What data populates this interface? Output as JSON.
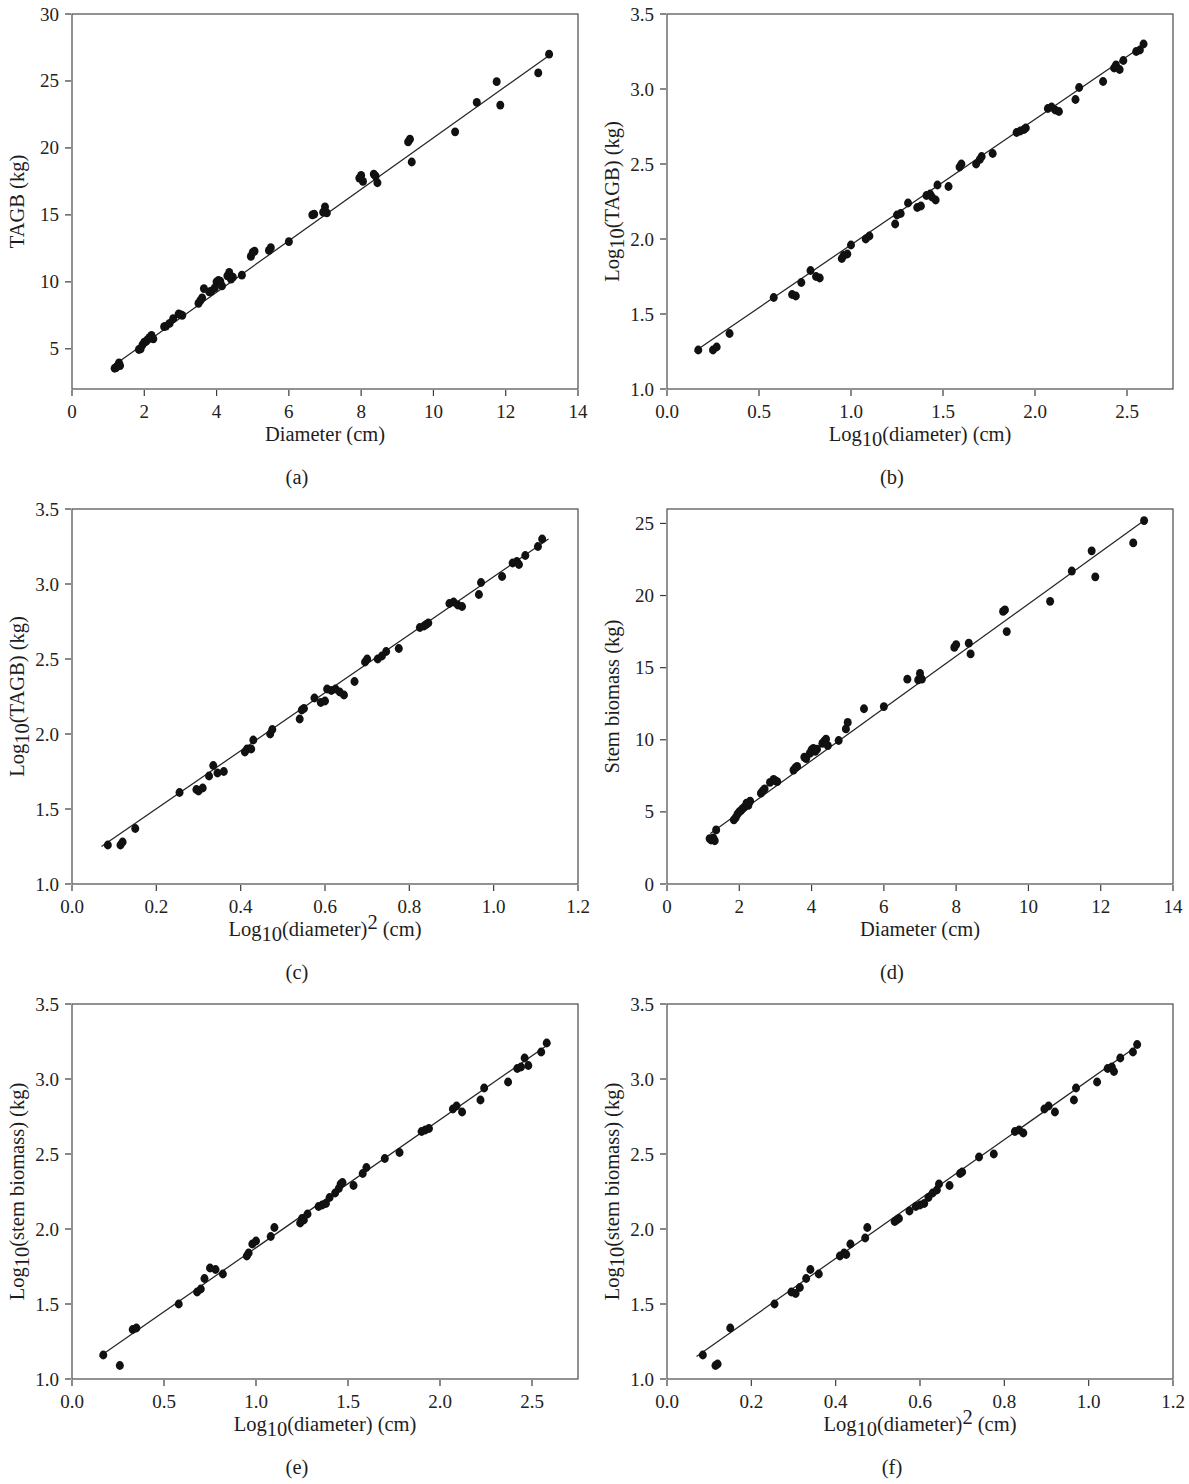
{
  "figure": {
    "name": "allometric-biomass-regression-figure",
    "panel_count": 6,
    "marker_color": "#111111",
    "line_color": "#242424",
    "axis_color": "#3a3a3a",
    "background_color": "#ffffff"
  },
  "panels": [
    {
      "caption": "(a)",
      "chart_data": {
        "type": "scatter",
        "title": "",
        "xlabel": "Diameter (cm)",
        "ylabel": "TAGB (kg)",
        "xlabel_parts": {
          "base": "Diameter (cm)",
          "sub": "",
          "sup": ""
        },
        "ylabel_parts": {
          "base": "TAGB (kg)",
          "sub": "",
          "sup": ""
        },
        "xlim": [
          0,
          14
        ],
        "ylim": [
          2,
          30
        ],
        "xticks": [
          0,
          2,
          4,
          6,
          8,
          10,
          12,
          14
        ],
        "xticklabels": [
          "0",
          "2",
          "4",
          "6",
          "8",
          "10",
          "12",
          "14"
        ],
        "yticks": [
          5,
          10,
          15,
          20,
          25,
          30
        ],
        "yticklabels": [
          "5",
          "10",
          "15",
          "20",
          "25",
          "30"
        ],
        "grid": false,
        "legend": "none",
        "fit_line": {
          "x": [
            1.15,
            13.25
          ],
          "y": [
            3.75,
            27.0
          ]
        },
        "x": [
          1.18,
          1.22,
          1.25,
          1.3,
          1.33,
          1.85,
          1.9,
          1.95,
          2.0,
          2.05,
          2.1,
          2.15,
          2.2,
          2.25,
          2.55,
          2.6,
          2.7,
          2.8,
          2.95,
          3.0,
          3.05,
          3.5,
          3.55,
          3.6,
          3.65,
          3.8,
          3.85,
          3.95,
          4.0,
          4.05,
          4.1,
          4.15,
          4.3,
          4.35,
          4.4,
          4.45,
          4.7,
          4.95,
          5.0,
          5.05,
          5.45,
          5.5,
          6.0,
          6.65,
          6.7,
          6.95,
          7.0,
          7.05,
          7.95,
          8.0,
          8.05,
          8.35,
          8.4,
          8.45,
          9.3,
          9.35,
          9.4,
          10.6,
          11.2,
          11.75,
          11.85,
          12.9,
          13.2
        ],
        "y": [
          3.55,
          3.6,
          3.7,
          3.95,
          3.75,
          4.95,
          5.0,
          5.3,
          5.5,
          5.55,
          5.7,
          5.85,
          6.0,
          5.75,
          6.65,
          6.7,
          6.9,
          7.25,
          7.6,
          7.55,
          7.5,
          8.4,
          8.6,
          8.8,
          9.5,
          9.25,
          9.3,
          9.55,
          10.0,
          10.1,
          10.05,
          9.7,
          10.45,
          10.7,
          10.2,
          10.35,
          10.5,
          11.9,
          12.2,
          12.3,
          12.35,
          12.55,
          13.0,
          15.0,
          15.05,
          15.2,
          15.6,
          15.15,
          17.75,
          17.95,
          17.5,
          18.05,
          17.9,
          17.4,
          20.45,
          20.65,
          18.95,
          21.2,
          23.4,
          24.95,
          23.2,
          25.6,
          27.0
        ]
      }
    },
    {
      "caption": "(b)",
      "chart_data": {
        "type": "scatter",
        "title": "",
        "xlabel": "Log10(diameter) (cm)",
        "ylabel": "Log10(TAGB) (kg)",
        "xlabel_parts": {
          "base": "Log",
          "sub": "10",
          "rest": "(diameter) (cm)",
          "sup": ""
        },
        "ylabel_parts": {
          "base": "Log",
          "sub": "10",
          "rest": "(TAGB) (kg)",
          "sup": ""
        },
        "xlim": [
          0.0,
          2.75
        ],
        "ylim": [
          1.0,
          3.5
        ],
        "xticks": [
          0.0,
          0.5,
          1.0,
          1.5,
          2.0,
          2.5
        ],
        "xticklabels": [
          "0.0",
          "0.5",
          "1.0",
          "1.5",
          "2.0",
          "2.5"
        ],
        "yticks": [
          1.0,
          1.5,
          2.0,
          2.5,
          3.0,
          3.5
        ],
        "yticklabels": [
          "1.0",
          "1.5",
          "2.0",
          "2.5",
          "3.0",
          "3.5"
        ],
        "grid": false,
        "legend": "none",
        "fit_line": {
          "x": [
            0.15,
            2.6
          ],
          "y": [
            1.25,
            3.3
          ]
        },
        "x": [
          0.17,
          0.25,
          0.27,
          0.34,
          0.58,
          0.68,
          0.7,
          0.73,
          0.78,
          0.81,
          0.83,
          0.95,
          0.96,
          0.98,
          1.0,
          1.08,
          1.1,
          1.24,
          1.25,
          1.27,
          1.31,
          1.36,
          1.38,
          1.41,
          1.43,
          1.44,
          1.46,
          1.47,
          1.53,
          1.59,
          1.6,
          1.68,
          1.7,
          1.71,
          1.77,
          1.9,
          1.92,
          1.94,
          1.95,
          2.07,
          2.09,
          2.11,
          2.13,
          2.22,
          2.24,
          2.37,
          2.43,
          2.44,
          2.46,
          2.48,
          2.55,
          2.57,
          2.59
        ],
        "y": [
          1.26,
          1.26,
          1.28,
          1.37,
          1.61,
          1.63,
          1.62,
          1.71,
          1.79,
          1.75,
          1.74,
          1.87,
          1.89,
          1.9,
          1.96,
          2.0,
          2.02,
          2.1,
          2.16,
          2.17,
          2.24,
          2.21,
          2.22,
          2.29,
          2.3,
          2.28,
          2.26,
          2.36,
          2.35,
          2.48,
          2.5,
          2.5,
          2.53,
          2.55,
          2.57,
          2.71,
          2.72,
          2.73,
          2.74,
          2.87,
          2.88,
          2.86,
          2.85,
          2.93,
          3.01,
          3.05,
          3.14,
          3.16,
          3.13,
          3.19,
          3.25,
          3.26,
          3.3
        ]
      }
    },
    {
      "caption": "(c)",
      "chart_data": {
        "type": "scatter",
        "title": "",
        "xlabel": "Log10(diameter)2 (cm)",
        "ylabel": "Log10(TAGB) (kg)",
        "xlabel_parts": {
          "base": "Log",
          "sub": "10",
          "rest": "(diameter)",
          "sup": "2",
          "tail": " (cm)"
        },
        "ylabel_parts": {
          "base": "Log",
          "sub": "10",
          "rest": "(TAGB) (kg)",
          "sup": ""
        },
        "xlim": [
          0.0,
          1.2
        ],
        "ylim": [
          1.0,
          3.5
        ],
        "xticks": [
          0.0,
          0.2,
          0.4,
          0.6,
          0.8,
          1.0,
          1.2
        ],
        "xticklabels": [
          "0.0",
          "0.2",
          "0.4",
          "0.6",
          "0.8",
          "1.0",
          "1.2"
        ],
        "yticks": [
          1.0,
          1.5,
          2.0,
          2.5,
          3.0,
          3.5
        ],
        "yticklabels": [
          "1.0",
          "1.5",
          "2.0",
          "2.5",
          "3.0",
          "3.5"
        ],
        "grid": false,
        "legend": "none",
        "fit_line": {
          "x": [
            0.07,
            1.13
          ],
          "y": [
            1.25,
            3.3
          ]
        },
        "x": [
          0.085,
          0.115,
          0.12,
          0.15,
          0.255,
          0.295,
          0.3,
          0.31,
          0.325,
          0.335,
          0.345,
          0.36,
          0.41,
          0.415,
          0.425,
          0.43,
          0.47,
          0.475,
          0.54,
          0.545,
          0.55,
          0.575,
          0.59,
          0.6,
          0.605,
          0.615,
          0.625,
          0.635,
          0.645,
          0.67,
          0.695,
          0.7,
          0.725,
          0.735,
          0.745,
          0.775,
          0.825,
          0.835,
          0.84,
          0.845,
          0.895,
          0.905,
          0.915,
          0.925,
          0.965,
          0.97,
          1.02,
          1.045,
          1.055,
          1.06,
          1.075,
          1.105,
          1.115
        ],
        "y": [
          1.26,
          1.26,
          1.28,
          1.37,
          1.61,
          1.63,
          1.62,
          1.64,
          1.72,
          1.79,
          1.74,
          1.75,
          1.88,
          1.9,
          1.9,
          1.96,
          2.0,
          2.03,
          2.1,
          2.16,
          2.17,
          2.24,
          2.21,
          2.22,
          2.3,
          2.29,
          2.3,
          2.28,
          2.26,
          2.35,
          2.48,
          2.5,
          2.5,
          2.52,
          2.55,
          2.57,
          2.71,
          2.72,
          2.73,
          2.74,
          2.87,
          2.88,
          2.86,
          2.85,
          2.93,
          3.01,
          3.05,
          3.14,
          3.15,
          3.13,
          3.19,
          3.25,
          3.3
        ]
      }
    },
    {
      "caption": "(d)",
      "chart_data": {
        "type": "scatter",
        "title": "",
        "xlabel": "Diameter (cm)",
        "ylabel": "Stem biomass (kg)",
        "xlabel_parts": {
          "base": "Diameter (cm)",
          "sub": "",
          "sup": ""
        },
        "ylabel_parts": {
          "base": "Stem biomass (kg)",
          "sub": "",
          "sup": ""
        },
        "xlim": [
          0,
          14
        ],
        "ylim": [
          0,
          26
        ],
        "xticks": [
          0,
          2,
          4,
          6,
          8,
          10,
          12,
          14
        ],
        "xticklabels": [
          "0",
          "2",
          "4",
          "6",
          "8",
          "10",
          "12",
          "14"
        ],
        "yticks": [
          0,
          5,
          10,
          15,
          20,
          25
        ],
        "yticklabels": [
          "0",
          "5",
          "10",
          "15",
          "20",
          "25"
        ],
        "grid": false,
        "legend": "none",
        "fit_line": {
          "x": [
            1.2,
            13.2
          ],
          "y": [
            3.5,
            25.2
          ]
        },
        "x": [
          1.18,
          1.22,
          1.28,
          1.32,
          1.36,
          1.85,
          1.9,
          1.95,
          2.0,
          2.05,
          2.1,
          2.15,
          2.2,
          2.25,
          2.3,
          2.6,
          2.65,
          2.7,
          2.85,
          2.95,
          3.0,
          3.05,
          3.5,
          3.55,
          3.6,
          3.8,
          3.85,
          3.95,
          4.0,
          4.05,
          4.1,
          4.15,
          4.3,
          4.35,
          4.4,
          4.45,
          4.75,
          4.95,
          5.0,
          5.45,
          6.0,
          6.65,
          6.95,
          7.0,
          7.05,
          7.95,
          8.0,
          8.35,
          8.4,
          9.3,
          9.35,
          9.4,
          10.6,
          11.2,
          11.75,
          11.85,
          12.9,
          13.2
        ],
        "y": [
          3.15,
          3.05,
          3.2,
          3.0,
          3.75,
          4.45,
          4.6,
          4.85,
          5.0,
          5.1,
          5.25,
          5.35,
          5.6,
          5.45,
          5.75,
          6.3,
          6.45,
          6.6,
          7.05,
          7.25,
          7.15,
          7.1,
          7.9,
          8.05,
          8.15,
          8.8,
          8.7,
          9.05,
          9.3,
          9.4,
          9.2,
          9.35,
          9.75,
          9.9,
          10.05,
          9.6,
          9.95,
          10.75,
          11.2,
          12.15,
          12.3,
          14.2,
          14.15,
          14.6,
          14.2,
          16.4,
          16.6,
          16.7,
          15.95,
          18.9,
          19.0,
          17.5,
          19.6,
          21.7,
          23.1,
          21.3,
          23.65,
          25.2
        ]
      }
    },
    {
      "caption": "(e)",
      "chart_data": {
        "type": "scatter",
        "title": "",
        "xlabel": "Log10(diameter) (cm)",
        "ylabel": "Log10(stem biomass) (kg)",
        "xlabel_parts": {
          "base": "Log",
          "sub": "10",
          "rest": "(diameter) (cm)",
          "sup": ""
        },
        "ylabel_parts": {
          "base": "Log",
          "sub": "10",
          "rest": "(stem biomass) (kg)",
          "sup": ""
        },
        "xlim": [
          0.0,
          2.75
        ],
        "ylim": [
          1.0,
          3.5
        ],
        "xticks": [
          0.0,
          0.5,
          1.0,
          1.5,
          2.0,
          2.5
        ],
        "xticklabels": [
          "0.0",
          "0.5",
          "1.0",
          "1.5",
          "2.0",
          "2.5"
        ],
        "yticks": [
          1.0,
          1.5,
          2.0,
          2.5,
          3.0,
          3.5
        ],
        "yticklabels": [
          "1.0",
          "1.5",
          "2.0",
          "2.5",
          "3.0",
          "3.5"
        ],
        "grid": false,
        "legend": "none",
        "fit_line": {
          "x": [
            0.15,
            2.6
          ],
          "y": [
            1.15,
            3.24
          ]
        },
        "x": [
          0.17,
          0.26,
          0.33,
          0.35,
          0.58,
          0.68,
          0.7,
          0.72,
          0.75,
          0.78,
          0.82,
          0.95,
          0.96,
          0.98,
          1.0,
          1.08,
          1.1,
          1.24,
          1.25,
          1.26,
          1.28,
          1.34,
          1.36,
          1.38,
          1.4,
          1.43,
          1.45,
          1.46,
          1.47,
          1.53,
          1.58,
          1.6,
          1.7,
          1.78,
          1.9,
          1.92,
          1.94,
          2.07,
          2.09,
          2.12,
          2.22,
          2.24,
          2.37,
          2.42,
          2.44,
          2.46,
          2.48,
          2.55,
          2.58
        ],
        "y": [
          1.16,
          1.09,
          1.33,
          1.34,
          1.5,
          1.58,
          1.6,
          1.67,
          1.74,
          1.73,
          1.7,
          1.82,
          1.84,
          1.9,
          1.92,
          1.95,
          2.01,
          2.04,
          2.07,
          2.06,
          2.1,
          2.15,
          2.16,
          2.17,
          2.21,
          2.24,
          2.27,
          2.3,
          2.31,
          2.29,
          2.37,
          2.41,
          2.47,
          2.51,
          2.65,
          2.66,
          2.67,
          2.8,
          2.82,
          2.78,
          2.86,
          2.94,
          2.98,
          3.07,
          3.08,
          3.14,
          3.09,
          3.18,
          3.24
        ]
      }
    },
    {
      "caption": "(f)",
      "chart_data": {
        "type": "scatter",
        "title": "",
        "xlabel": "Log10(diameter)2 (cm)",
        "ylabel": "Log10(stem biomass) (kg)",
        "xlabel_parts": {
          "base": "Log",
          "sub": "10",
          "rest": "(diameter)",
          "sup": "2",
          "tail": " (cm)"
        },
        "ylabel_parts": {
          "base": "Log",
          "sub": "10",
          "rest": "(stem biomass) (kg)",
          "sup": ""
        },
        "xlim": [
          0.0,
          1.2
        ],
        "ylim": [
          1.0,
          3.5
        ],
        "xticks": [
          0.0,
          0.2,
          0.4,
          0.6,
          0.8,
          1.0,
          1.2
        ],
        "xticklabels": [
          "0.0",
          "0.2",
          "0.4",
          "0.6",
          "0.8",
          "1.0",
          "1.2"
        ],
        "yticks": [
          1.0,
          1.5,
          2.0,
          2.5,
          3.0,
          3.5
        ],
        "yticklabels": [
          "1.0",
          "1.5",
          "2.0",
          "2.5",
          "3.0",
          "3.5"
        ],
        "grid": false,
        "legend": "none",
        "fit_line": {
          "x": [
            0.07,
            1.12
          ],
          "y": [
            1.15,
            3.23
          ]
        },
        "x": [
          0.085,
          0.115,
          0.12,
          0.15,
          0.255,
          0.295,
          0.305,
          0.315,
          0.33,
          0.34,
          0.36,
          0.41,
          0.42,
          0.425,
          0.435,
          0.47,
          0.475,
          0.54,
          0.545,
          0.55,
          0.575,
          0.59,
          0.6,
          0.61,
          0.62,
          0.63,
          0.64,
          0.645,
          0.67,
          0.695,
          0.7,
          0.74,
          0.775,
          0.825,
          0.835,
          0.845,
          0.895,
          0.905,
          0.92,
          0.965,
          0.97,
          1.02,
          1.045,
          1.055,
          1.06,
          1.075,
          1.105,
          1.115
        ],
        "y": [
          1.16,
          1.09,
          1.1,
          1.34,
          1.5,
          1.58,
          1.57,
          1.61,
          1.67,
          1.73,
          1.7,
          1.82,
          1.84,
          1.83,
          1.9,
          1.94,
          2.01,
          2.05,
          2.06,
          2.07,
          2.12,
          2.15,
          2.16,
          2.17,
          2.21,
          2.24,
          2.26,
          2.3,
          2.29,
          2.37,
          2.38,
          2.48,
          2.5,
          2.65,
          2.66,
          2.64,
          2.8,
          2.82,
          2.78,
          2.86,
          2.94,
          2.98,
          3.07,
          3.08,
          3.05,
          3.14,
          3.18,
          3.23
        ]
      }
    }
  ]
}
